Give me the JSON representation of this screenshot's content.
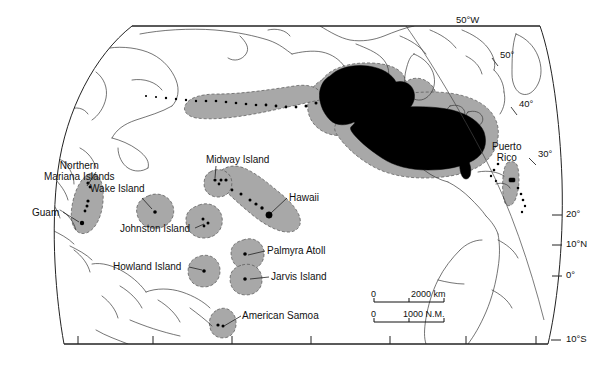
{
  "title": "United States Exclusive Economic Zone",
  "map": {
    "projection_outline": "globe-oval",
    "colors": {
      "eez_fill": "#a8a8a8",
      "land_us_fill": "#000000",
      "coastline": "#3a3a3a",
      "background": "#ffffff",
      "border": "#222222"
    },
    "place_labels": [
      {
        "name": "northern-mariana-islands",
        "text": "Northern\nMariana Islands",
        "line1": "Northern",
        "line2": "Mariana Islands",
        "x": 52,
        "y": 160
      },
      {
        "name": "guam",
        "text": "Guam",
        "x": 40,
        "y": 212
      },
      {
        "name": "wake-island",
        "text": "Wake Island",
        "x": 100,
        "y": 188
      },
      {
        "name": "johnston-island",
        "text": "Johnston Island",
        "x": 131,
        "y": 229
      },
      {
        "name": "midway-island",
        "text": "Midway Island",
        "x": 207,
        "y": 157
      },
      {
        "name": "hawaii",
        "text": "Hawaii",
        "x": 290,
        "y": 196
      },
      {
        "name": "palmyra-atoll",
        "text": "Palmyra Atoll",
        "x": 268,
        "y": 251
      },
      {
        "name": "jarvis-island",
        "text": "Jarvis Island",
        "x": 272,
        "y": 277
      },
      {
        "name": "howland-island",
        "text": "Howland Island",
        "x": 115,
        "y": 265
      },
      {
        "name": "american-samoa",
        "text": "American Samoa",
        "x": 243,
        "y": 314
      },
      {
        "name": "puerto-rico",
        "text": "Puerto\nRico",
        "line1": "Puerto",
        "line2": "Rico",
        "x": 497,
        "y": 143
      }
    ],
    "graticule_labels": [
      {
        "name": "longitude-50w",
        "text": "50°W",
        "x": 459,
        "y": 20
      },
      {
        "name": "latitude-50",
        "text": "50°",
        "x": 503,
        "y": 55
      },
      {
        "name": "latitude-40",
        "text": "40°",
        "x": 521,
        "y": 103
      },
      {
        "name": "latitude-30",
        "text": "30°",
        "x": 540,
        "y": 152
      },
      {
        "name": "latitude-20",
        "text": "20°",
        "x": 556,
        "y": 212
      },
      {
        "name": "latitude-10n",
        "text": "10°N",
        "x": 556,
        "y": 240
      },
      {
        "name": "latitude-0",
        "text": "0°",
        "x": 562,
        "y": 271
      },
      {
        "name": "latitude-10s",
        "text": "10°S",
        "x": 556,
        "y": 337
      }
    ],
    "scale_bar": {
      "name": "scale-bar",
      "rows": [
        {
          "zero": "0",
          "value": "2000 km"
        },
        {
          "zero": "0",
          "value": "1000 N.M."
        }
      ]
    }
  }
}
